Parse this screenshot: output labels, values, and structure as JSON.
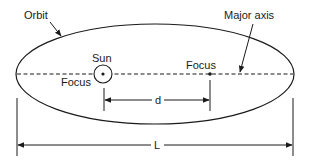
{
  "labels": {
    "orbit": "Orbit",
    "major_axis": "Major axis",
    "sun": "Sun",
    "focus_left": "Focus",
    "focus_right": "Focus",
    "distance_between_foci": "d",
    "major_axis_length": "L"
  },
  "colors": {
    "ink": "#1a1a1a",
    "background": "#ffffff"
  }
}
